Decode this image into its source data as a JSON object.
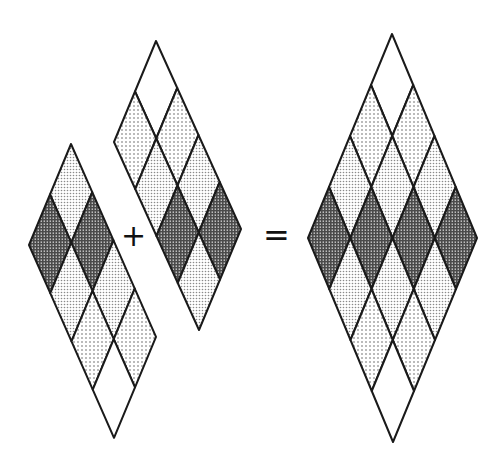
{
  "figure": {
    "operators": {
      "plus": "+",
      "equals": "="
    },
    "fills": {
      "W": {
        "name": "white",
        "color": "#ffffff"
      },
      "S": {
        "name": "sparse-dots",
        "color": "#ececec"
      },
      "L": {
        "name": "light-grey",
        "color": "#d4d4d4"
      },
      "D": {
        "name": "dark-grey",
        "color": "#8f8f8f"
      }
    },
    "stroke": "#1a1a1a",
    "shapes": [
      {
        "name": "left-strip",
        "top": [
          71,
          144
        ],
        "u": [
          -21,
          50.5
        ],
        "v": [
          21.25,
          48.2
        ],
        "grid": [
          [
            "L",
            "D",
            "L",
            "S"
          ],
          [
            "D",
            "L",
            "S",
            "W"
          ]
        ]
      },
      {
        "name": "middle-strip",
        "top": [
          156,
          41
        ],
        "u": [
          -21,
          50.5
        ],
        "v": [
          21.25,
          47
        ],
        "grid": [
          [
            "W",
            "S",
            "L",
            "D"
          ],
          [
            "S",
            "L",
            "D",
            "L"
          ]
        ]
      },
      {
        "name": "result-tiling",
        "top": [
          392,
          34
        ],
        "u": [
          -21,
          51
        ],
        "v": [
          21.25,
          51
        ],
        "grid": [
          [
            "W",
            "S",
            "L",
            "D"
          ],
          [
            "S",
            "L",
            "D",
            "L"
          ],
          [
            "L",
            "D",
            "L",
            "S"
          ],
          [
            "D",
            "L",
            "S",
            "W"
          ]
        ]
      }
    ]
  }
}
